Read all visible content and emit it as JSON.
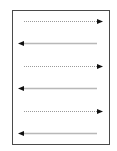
{
  "diagram": {
    "type": "reading-order-zigzag",
    "frame": {
      "x": 12,
      "y": 10,
      "width": 97,
      "height": 134,
      "border_color": "#4a4a4a"
    },
    "colors": {
      "dotted_line": "#9a9a9a",
      "solid_line": "#b8b8b8",
      "arrowhead": "#111111"
    },
    "arrows": [
      {
        "direction": "right",
        "style": "dotted",
        "y": 21,
        "x_start": 24,
        "x_end": 103
      },
      {
        "direction": "left",
        "style": "solid",
        "y": 43,
        "x_start": 97,
        "x_end": 18
      },
      {
        "direction": "right",
        "style": "dotted",
        "y": 66,
        "x_start": 24,
        "x_end": 103
      },
      {
        "direction": "left",
        "style": "solid",
        "y": 88,
        "x_start": 97,
        "x_end": 18
      },
      {
        "direction": "right",
        "style": "dotted",
        "y": 111,
        "x_start": 24,
        "x_end": 103
      },
      {
        "direction": "left",
        "style": "solid",
        "y": 133,
        "x_start": 97,
        "x_end": 18
      }
    ]
  }
}
